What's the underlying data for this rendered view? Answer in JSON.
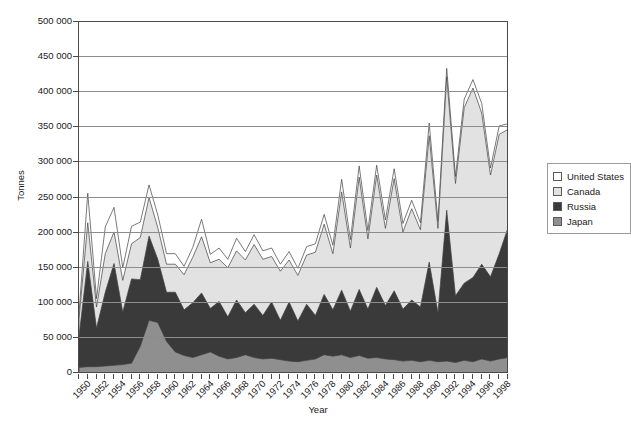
{
  "chart_data": {
    "type": "area",
    "stacked": true,
    "title": "",
    "xlabel": "Year",
    "ylabel": "Tonnes",
    "ylim": [
      0,
      500000
    ],
    "ytick_step": 50000,
    "ytick_labels": [
      "0",
      "50 000",
      "100 000",
      "150 000",
      "200 000",
      "250 000",
      "300 000",
      "350 000",
      "400 000",
      "450 000",
      "500 000"
    ],
    "grid": true,
    "legend_position": "right",
    "xtick_label_step": 2,
    "x": [
      1950,
      1951,
      1952,
      1953,
      1954,
      1955,
      1956,
      1957,
      1958,
      1959,
      1960,
      1961,
      1962,
      1963,
      1964,
      1965,
      1966,
      1967,
      1968,
      1969,
      1970,
      1971,
      1972,
      1973,
      1974,
      1975,
      1976,
      1977,
      1978,
      1979,
      1980,
      1981,
      1982,
      1983,
      1984,
      1985,
      1986,
      1987,
      1988,
      1989,
      1990,
      1991,
      1992,
      1993,
      1994,
      1995,
      1996,
      1997,
      1998,
      1999
    ],
    "xtick_labels": [
      "1950",
      "1952",
      "1954",
      "1956",
      "1958",
      "1960",
      "1962",
      "1964",
      "1966",
      "1968",
      "1970",
      "1972",
      "1974",
      "1976",
      "1978",
      "1980",
      "1982",
      "1984",
      "1986",
      "1988",
      "1990",
      "1992",
      "1994",
      "1996",
      "1998"
    ],
    "series": [
      {
        "name": "Japan",
        "color": "#8f8f8f",
        "values": [
          8000,
          9000,
          9000,
          10000,
          11000,
          12000,
          14000,
          38000,
          75000,
          72000,
          45000,
          30000,
          25000,
          22000,
          26000,
          30000,
          24000,
          20000,
          22000,
          26000,
          22000,
          20000,
          21000,
          19000,
          17000,
          16000,
          18000,
          20000,
          26000,
          24000,
          26000,
          22000,
          25000,
          21000,
          22000,
          20000,
          19000,
          17000,
          18000,
          16000,
          18000,
          16000,
          17000,
          15000,
          18000,
          16000,
          20000,
          17000,
          20000,
          22000
        ]
      },
      {
        "name": "Russia",
        "color": "#3a3a3a",
        "values": [
          44000,
          150000,
          55000,
          105000,
          145000,
          75000,
          120000,
          95000,
          120000,
          90000,
          70000,
          85000,
          65000,
          78000,
          88000,
          62000,
          78000,
          60000,
          82000,
          60000,
          76000,
          62000,
          80000,
          56000,
          84000,
          58000,
          80000,
          62000,
          86000,
          66000,
          92000,
          66000,
          94000,
          70000,
          100000,
          76000,
          98000,
          74000,
          86000,
          78000,
          140000,
          70000,
          215000,
          95000,
          110000,
          120000,
          135000,
          120000,
          150000,
          185000
        ]
      },
      {
        "name": "Canada",
        "color": "#e2e2e2",
        "values": [
          25000,
          55000,
          30000,
          55000,
          45000,
          45000,
          50000,
          60000,
          55000,
          45000,
          40000,
          40000,
          50000,
          65000,
          80000,
          65000,
          60000,
          70000,
          70000,
          75000,
          85000,
          80000,
          65000,
          70000,
          60000,
          65000,
          70000,
          90000,
          100000,
          80000,
          140000,
          90000,
          160000,
          100000,
          160000,
          110000,
          160000,
          110000,
          130000,
          110000,
          180000,
          120000,
          190000,
          160000,
          250000,
          270000,
          215000,
          145000,
          170000,
          140000
        ]
      },
      {
        "name": "United States",
        "color": "#ffffff",
        "values": [
          8000,
          42000,
          12000,
          38000,
          35000,
          18000,
          25000,
          22000,
          18000,
          18000,
          15000,
          15000,
          12000,
          14000,
          25000,
          12000,
          16000,
          12000,
          18000,
          12000,
          14000,
          12000,
          12000,
          10000,
          12000,
          10000,
          12000,
          12000,
          14000,
          12000,
          18000,
          12000,
          16000,
          12000,
          14000,
          12000,
          14000,
          12000,
          12000,
          10000,
          18000,
          10000,
          12000,
          10000,
          12000,
          12000,
          14000,
          10000,
          12000,
          8000
        ]
      }
    ]
  },
  "legend": {
    "items": [
      {
        "label": "United States",
        "color": "#ffffff"
      },
      {
        "label": "Canada",
        "color": "#e2e2e2"
      },
      {
        "label": "Russia",
        "color": "#3a3a3a"
      },
      {
        "label": "Japan",
        "color": "#8f8f8f"
      }
    ]
  }
}
